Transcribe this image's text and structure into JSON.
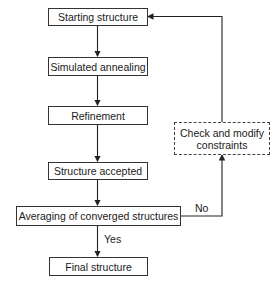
{
  "diagram": {
    "type": "flowchart",
    "nodes": [
      {
        "id": "start",
        "label": "Starting structure"
      },
      {
        "id": "sa",
        "label": "Simulated annealing"
      },
      {
        "id": "refine",
        "label": "Refinement"
      },
      {
        "id": "accepted",
        "label": "Structure accepted"
      },
      {
        "id": "avg",
        "label": "Averaging of converged structures"
      },
      {
        "id": "final",
        "label": "Final structure"
      },
      {
        "id": "check",
        "label": "Check and modify constraints",
        "style": "dashed"
      }
    ],
    "edges": [
      {
        "from": "start",
        "to": "sa",
        "label": ""
      },
      {
        "from": "sa",
        "to": "refine",
        "label": ""
      },
      {
        "from": "refine",
        "to": "accepted",
        "label": ""
      },
      {
        "from": "accepted",
        "to": "avg",
        "label": ""
      },
      {
        "from": "avg",
        "to": "final",
        "label": "Yes"
      },
      {
        "from": "avg",
        "to": "check",
        "label": "No"
      },
      {
        "from": "check",
        "to": "start",
        "label": ""
      }
    ],
    "edge_labels": {
      "yes": "Yes",
      "no": "No"
    }
  }
}
